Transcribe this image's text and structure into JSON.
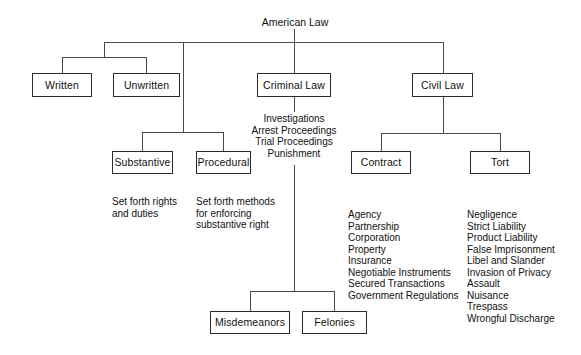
{
  "diagram": {
    "type": "organizational-tree",
    "title": "American Law",
    "line_color": "#4a4a4a",
    "box_border_color": "#2b2b2b",
    "text_color": "#111111",
    "background": "#ffffff"
  },
  "root": {
    "label": "American Law"
  },
  "boxes": {
    "written": {
      "label": "Written"
    },
    "unwritten": {
      "label": "Unwritten"
    },
    "criminal_law": {
      "label": "Criminal Law"
    },
    "civil_law": {
      "label": "Civil Law"
    },
    "substantive": {
      "label": "Substantive"
    },
    "procedural": {
      "label": "Procedural"
    },
    "contract": {
      "label": "Contract"
    },
    "tort": {
      "label": "Tort"
    },
    "misdemeanors": {
      "label": "Misdemeanors"
    },
    "felonies": {
      "label": "Felonies"
    }
  },
  "annotations": {
    "criminal_process": "Investigations\nArrest Proceedings\nTrial Proceedings\nPunishment",
    "substantive_desc": "Set forth rights\nand duties",
    "procedural_desc": "Set forth methods\nfor enforcing\nsubstantive right"
  },
  "lists": {
    "contract_items": [
      "Agency",
      "Partnership",
      "Corporation",
      "Property",
      "Insurance",
      "Negotiable Instruments",
      "Secured Transactions",
      "Government Regulations"
    ],
    "tort_items": [
      "Negligence",
      "Strict Liability",
      "Product Liability",
      "False Imprisonment",
      "Libel and Slander",
      "Invasion of Privacy",
      "Assault",
      "Nuisance",
      "Trespass",
      "Wrongful Discharge"
    ]
  }
}
